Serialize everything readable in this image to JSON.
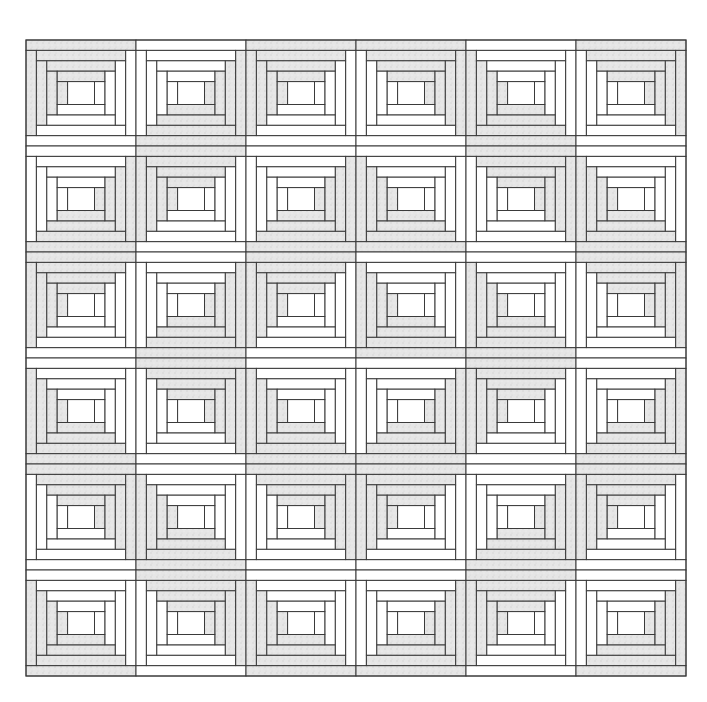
{
  "figure": {
    "rows": 6,
    "cols": 6,
    "bounds": {
      "x": 26,
      "y": 40,
      "width": 660,
      "height": 636
    },
    "colors": {
      "background": "#ffffff",
      "line": "#3a3a3a",
      "shade": "#e2e2e2",
      "light": "#ffffff"
    },
    "rings": 4,
    "dark_corners": [
      [
        "tl",
        "br",
        "tl",
        "tr",
        "bl",
        "tr"
      ],
      [
        "br",
        "tl",
        "br",
        "bl",
        "tr",
        "bl"
      ],
      [
        "tl",
        "br",
        "tl",
        "bl",
        "bl",
        "tr"
      ],
      [
        "bl",
        "tr",
        "bl",
        "br",
        "tl",
        "br"
      ],
      [
        "tr",
        "bl",
        "tr",
        "tl",
        "br",
        "tl"
      ],
      [
        "bl",
        "tr",
        "bl",
        "br",
        "tl",
        "br"
      ]
    ],
    "col_edges": [
      26,
      136,
      246,
      356,
      466,
      576,
      686
    ],
    "row_edges": [
      40,
      146,
      252,
      358,
      464,
      570,
      676
    ]
  }
}
